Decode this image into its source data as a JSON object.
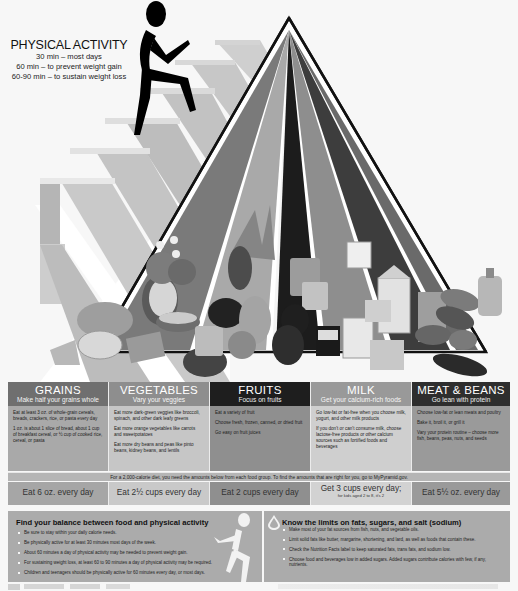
{
  "physical_activity": {
    "title": "PHYSICAL ACTIVITY",
    "lines": [
      "30 min – most days",
      "60 min – to prevent weight gain",
      "60-90 min – to sustain weight loss"
    ],
    "icon": "stair-climber-icon"
  },
  "pyramid": {
    "icon": "food-pyramid-icon",
    "stripe_colors": [
      "#7a7a7a",
      "#a9a9a9",
      "#1c1c1c",
      "#8e8e8e",
      "#3d3d3d",
      "#6a6a6a"
    ],
    "food_items_visible": [
      "bread",
      "cereal bowl",
      "popcorn",
      "pasta",
      "crackers",
      "broccoli",
      "carrots",
      "peaches can",
      "raisins box",
      "grapes",
      "milk carton",
      "yogurt",
      "cheese",
      "eggs",
      "fish",
      "beans",
      "oil bottle",
      "tomato",
      "corn"
    ],
    "labels": {
      "peaches_can": "PEACHES",
      "raisins_box": "RAISINS",
      "milk_carton": "MILK",
      "small_milk_carton": "1% MILK"
    }
  },
  "food_groups": [
    {
      "name": "GRAINS",
      "tagline": "Make half your grains whole",
      "header_color": "#6f6f6f",
      "body_color": "#a9a9a9",
      "tips": [
        "Eat at least 3 oz. of whole-grain cereals, breads, crackers, rice, or pasta every day",
        "1 oz. is about 1 slice of bread, about 1 cup of breakfast cereal, or ½ cup of cooked rice, cereal, or pasta"
      ],
      "serving": "Eat 6 oz. every day",
      "serving_note": ""
    },
    {
      "name": "VEGETABLES",
      "tagline": "Vary your veggies",
      "header_color": "#8e8e8e",
      "body_color": "#c6c6c6",
      "tips": [
        "Eat more dark-green veggies like broccoli, spinach, and other dark leafy greens",
        "Eat more orange vegetables like carrots and sweetpotatoes",
        "Eat more dry beans and peas like pinto beans, kidney beans, and lentils"
      ],
      "serving": "Eat 2½ cups every day",
      "serving_note": ""
    },
    {
      "name": "FRUITS",
      "tagline": "Focus on fruits",
      "header_color": "#1e1e1e",
      "body_color": "#8f8f8f",
      "tips": [
        "Eat a variety of fruit",
        "Choose fresh, frozen, canned, or dried fruit",
        "Go easy on fruit juices"
      ],
      "serving": "Eat 2 cups every day",
      "serving_note": ""
    },
    {
      "name": "MILK",
      "tagline": "Get your calcium-rich foods",
      "header_color": "#999999",
      "body_color": "#cfcfcf",
      "tips": [
        "Go low-fat or fat-free when you choose milk, yogurt, and other milk products",
        "If you don't or can't consume milk, choose lactose-free products or other calcium sources such as fortified foods and beverages"
      ],
      "serving": "Get 3 cups every day;",
      "serving_note": "for kids aged 2 to 8, it's 2"
    },
    {
      "name": "MEAT & BEANS",
      "tagline": "Go lean with protein",
      "header_color": "#2e2e2e",
      "body_color": "#9a9a9a",
      "tips": [
        "Choose low-fat or lean meats and poultry",
        "Bake it, broil it, or grill it",
        "Vary your protein routine – choose more fish, beans, peas, nuts, and seeds"
      ],
      "serving": "Eat 5½ oz. every day",
      "serving_note": ""
    }
  ],
  "calorie_banner": "For a 2,000-calorie diet, you need the amounts below from each food group. To find the amounts that are right for you, go to MyPyramid.gov.",
  "balance_panel": {
    "title": "Find your balance between food and physical activity",
    "icon": "runner-icon",
    "bullets": [
      "Be sure to stay within your daily calorie needs.",
      "Be physically active for at least 30 minutes most days of the week.",
      "About 60 minutes a day of physical activity may be needed to prevent weight gain.",
      "For sustaining weight loss, at least 60 to 90 minutes a day of physical activity may be required.",
      "Children and teenagers should be physically active for 60 minutes every day, or most days."
    ]
  },
  "limits_panel": {
    "title": "Know the limits on fats, sugars, and salt (sodium)",
    "icon": "oil-drop-icon",
    "bullets": [
      "Make most of your fat sources from fish, nuts, and vegetable oils.",
      "Limit solid fats like butter, margarine, shortening, and lard, as well as foods that contain these.",
      "Check the Nutrition Facts label to keep saturated fats, trans fats, and sodium low.",
      "Choose food and beverages low in added sugars. Added sugars contribute calories with few, if any, nutrients."
    ]
  },
  "colors": {
    "page_bg": "#f7f7f7",
    "banner_bg": "#b5b5b5",
    "panel_bg": "#ababab",
    "stair_light": "#c9c9c9",
    "stair_dark": "#9c9c9c"
  }
}
